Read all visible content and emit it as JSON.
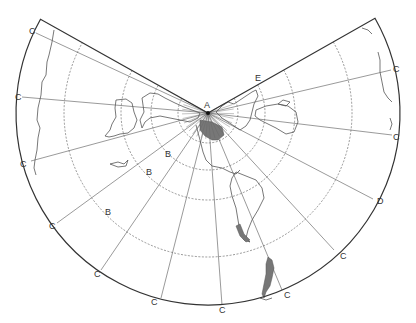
{
  "figure": {
    "type": "Conic projection diagram (world map on cone development)",
    "apex": {
      "label": "A",
      "x": 208,
      "y": 113
    },
    "outer_radius": 192,
    "parallel_radii": [
      30,
      57,
      87,
      144
    ],
    "labels": [
      {
        "text": "A",
        "x": 204,
        "y": 108
      },
      {
        "text": "B",
        "x": 165,
        "y": 157
      },
      {
        "text": "B",
        "x": 146,
        "y": 175
      },
      {
        "text": "B",
        "x": 105,
        "y": 215
      },
      {
        "text": "C",
        "x": 29,
        "y": 34
      },
      {
        "text": "C",
        "x": 15,
        "y": 100
      },
      {
        "text": "C",
        "x": 20,
        "y": 167
      },
      {
        "text": "C",
        "x": 49,
        "y": 229
      },
      {
        "text": "C",
        "x": 94,
        "y": 277
      },
      {
        "text": "C",
        "x": 151,
        "y": 305
      },
      {
        "text": "C",
        "x": 219,
        "y": 313
      },
      {
        "text": "C",
        "x": 284,
        "y": 298
      },
      {
        "text": "C",
        "x": 340,
        "y": 259
      },
      {
        "text": "C",
        "x": 393,
        "y": 140
      },
      {
        "text": "C",
        "x": 393,
        "y": 72
      },
      {
        "text": "D",
        "x": 377,
        "y": 204
      },
      {
        "text": "E",
        "x": 255,
        "y": 81
      }
    ],
    "meridian_ends": [
      [
        36,
        33
      ],
      [
        22,
        97
      ],
      [
        31,
        161
      ],
      [
        57,
        223
      ],
      [
        101,
        270
      ],
      [
        161,
        298
      ],
      [
        222,
        305
      ],
      [
        282,
        290
      ],
      [
        334,
        250
      ],
      [
        373,
        199
      ],
      [
        392,
        135
      ],
      [
        391,
        70
      ]
    ]
  }
}
